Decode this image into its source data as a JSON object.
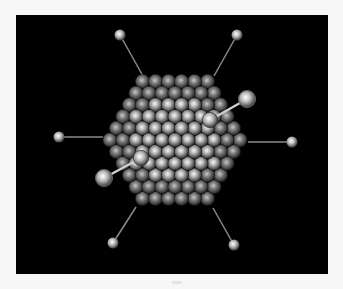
{
  "image": {
    "subject": "icosahedral virus capsid with fiber spikes",
    "background_color": "#000000",
    "frame_color": "#f6f6f6"
  },
  "capsid": {
    "center": [
      175,
      140
    ],
    "hex_radius": 76,
    "sphere_spacing": 13,
    "sphere_radius": 7.2,
    "colors": {
      "highlight": "#f4f4f4",
      "mid": "#9a9a9a",
      "shadow": "#2a2a2a"
    }
  },
  "fibers": [
    {
      "from": [
        143,
        76
      ],
      "to": [
        120,
        35
      ],
      "knob_r": 5.5
    },
    {
      "from": [
        214,
        76
      ],
      "to": [
        237,
        35
      ],
      "knob_r": 5.5
    },
    {
      "from": [
        103,
        137
      ],
      "to": [
        59,
        137
      ],
      "knob_r": 5.5
    },
    {
      "from": [
        248,
        142
      ],
      "to": [
        292,
        142
      ],
      "knob_r": 5.5
    },
    {
      "from": [
        136,
        207
      ],
      "to": [
        113,
        243
      ],
      "knob_r": 5.5
    },
    {
      "from": [
        213,
        208
      ],
      "to": [
        234,
        245
      ],
      "knob_r": 5.5
    },
    {
      "from": [
        210,
        120
      ],
      "to": [
        247,
        99
      ],
      "knob_r": 8.5,
      "front": true
    },
    {
      "from": [
        141,
        158
      ],
      "to": [
        104,
        178
      ],
      "knob_r": 8.5,
      "front": true
    }
  ]
}
